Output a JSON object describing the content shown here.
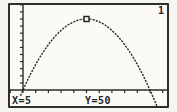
{
  "screen": {
    "function_number_label": "1",
    "trace_readout": {
      "x_label": "X=5",
      "y_label": "Y=50"
    }
  },
  "colors": {
    "ink": "#2a2a2a",
    "screen_bg": "#fbfaf6",
    "frame": "#2f2f2f"
  },
  "chart_data": {
    "type": "line",
    "title": "",
    "xlabel": "",
    "ylabel": "",
    "legend": "none",
    "grid": false,
    "axes": {
      "xmin": -1,
      "xmax": 11.4,
      "ymin": -13,
      "ymax": 60,
      "xscl": 1,
      "yscl": 5
    },
    "x": [
      -0.2,
      0,
      0.2,
      0.4,
      0.6,
      0.8,
      1,
      1.2,
      1.4,
      1.6,
      1.8,
      2,
      2.2,
      2.4,
      2.6,
      2.8,
      3,
      3.2,
      3.4,
      3.6,
      3.8,
      4,
      4.2,
      4.4,
      4.6,
      4.8,
      5,
      5.2,
      5.4,
      5.6,
      5.8,
      6,
      6.2,
      6.4,
      6.6,
      6.8,
      7,
      7.2,
      7.4,
      7.6,
      7.8,
      8,
      8.2,
      8.4,
      8.6,
      8.8,
      9,
      9.2,
      9.4,
      9.6,
      9.8,
      10,
      10.2,
      10.4,
      10.6
    ],
    "y": [
      -4.1,
      0,
      3.9,
      7.7,
      11.3,
      14.7,
      18,
      21.1,
      24.1,
      26.9,
      29.5,
      32,
      34.3,
      36.5,
      38.5,
      40.3,
      42,
      43.5,
      44.9,
      46.1,
      47.1,
      48,
      48.7,
      49.3,
      49.7,
      49.9,
      50,
      49.9,
      49.7,
      49.3,
      48.7,
      48,
      47.1,
      46.1,
      44.9,
      43.5,
      42,
      40.3,
      38.5,
      36.5,
      34.3,
      32,
      29.5,
      26.9,
      24.1,
      21.1,
      18,
      14.7,
      11.3,
      7.7,
      3.9,
      0,
      -4.1,
      -8.3,
      -12.7
    ],
    "x_intercepts": [
      0,
      10
    ],
    "vertex": {
      "x": 5,
      "y": 50
    },
    "trace_point": {
      "x": 5,
      "y": 50
    }
  }
}
